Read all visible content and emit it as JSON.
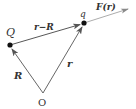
{
  "diagram": {
    "title": "",
    "colors": {
      "line": "#555555",
      "dot": "#111111",
      "text": "#333333"
    },
    "points": {
      "origin": {
        "label": "O",
        "x": 43,
        "y": 93
      },
      "source_charge": {
        "label": "Q",
        "x": 10,
        "y": 45
      },
      "test_charge": {
        "label": "q",
        "x": 84,
        "y": 23
      }
    },
    "vectors": {
      "R": {
        "label": "R",
        "from": "O",
        "to": "Q"
      },
      "r": {
        "label": "r",
        "from": "O",
        "to": "q"
      },
      "r_minus_R": {
        "label": "r−R",
        "from": "Q",
        "to": "q"
      },
      "force": {
        "label": "F(r)",
        "from": "q",
        "direction": "along r−R"
      }
    }
  }
}
